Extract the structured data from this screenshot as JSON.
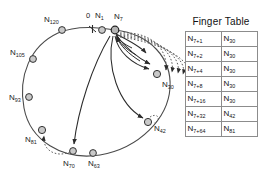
{
  "figure": {
    "type": "chord-dht-ring-diagram",
    "origin_tick_label": "0",
    "identifier_ring": {
      "nodes": [
        {
          "id": "N1",
          "label_base": "N",
          "label_sub": "1",
          "cx": 102,
          "cy": 30,
          "highlight": false
        },
        {
          "id": "N7",
          "label_base": "N",
          "label_sub": "7",
          "cx": 115,
          "cy": 30,
          "highlight": true
        },
        {
          "id": "N30",
          "label_base": "N",
          "label_sub": "30",
          "cx": 157,
          "cy": 74,
          "highlight": false
        },
        {
          "id": "N42",
          "label_base": "N",
          "label_sub": "42",
          "cx": 148,
          "cy": 122,
          "highlight": false
        },
        {
          "id": "N63",
          "label_base": "N",
          "label_sub": "63",
          "cx": 93,
          "cy": 153,
          "highlight": false
        },
        {
          "id": "N70",
          "label_base": "N",
          "label_sub": "70",
          "cx": 73,
          "cy": 151,
          "highlight": false
        },
        {
          "id": "N81",
          "label_base": "N",
          "label_sub": "81",
          "cx": 42,
          "cy": 130,
          "highlight": false
        },
        {
          "id": "N93",
          "label_base": "N",
          "label_sub": "93",
          "cx": 29,
          "cy": 97,
          "highlight": false
        },
        {
          "id": "N105",
          "label_base": "N",
          "label_sub": "105",
          "cx": 33,
          "cy": 59,
          "highlight": false
        },
        {
          "id": "N120",
          "label_base": "N",
          "label_sub": "120",
          "cx": 62,
          "cy": 30,
          "highlight": false
        }
      ]
    },
    "colors": {
      "node_fill": "#c9c9c9",
      "node_stroke": "#333333",
      "ring_stroke": "#4a4a4a",
      "chord_stroke": "#2b2b2b",
      "finger_arc_stroke": "#555555",
      "table_border": "#8c8c8c",
      "text": "#111111",
      "background": "#ffffff"
    }
  },
  "finger_table": {
    "title": "Finger Table",
    "columns": [
      "key",
      "successor"
    ],
    "rows": [
      {
        "key_base": "N",
        "key_sub": "7+1",
        "succ_base": "N",
        "succ_sub": "30"
      },
      {
        "key_base": "N",
        "key_sub": "7+2",
        "succ_base": "N",
        "succ_sub": "30"
      },
      {
        "key_base": "N",
        "key_sub": "7+4",
        "succ_base": "N",
        "succ_sub": "30"
      },
      {
        "key_base": "N",
        "key_sub": "7+8",
        "succ_base": "N",
        "succ_sub": "30"
      },
      {
        "key_base": "N",
        "key_sub": "7+16",
        "succ_base": "N",
        "succ_sub": "30"
      },
      {
        "key_base": "N",
        "key_sub": "7+32",
        "succ_base": "N",
        "succ_sub": "42"
      },
      {
        "key_base": "N",
        "key_sub": "7+64",
        "succ_base": "N",
        "succ_sub": "81"
      }
    ]
  }
}
